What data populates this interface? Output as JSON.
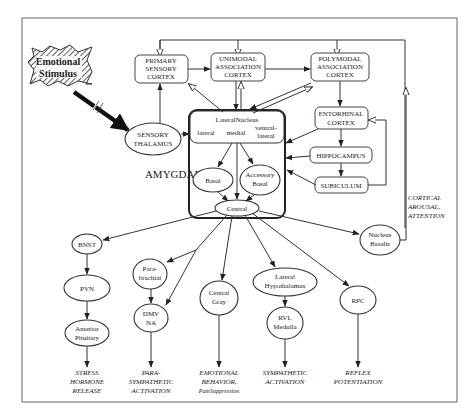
{
  "diagram": {
    "stimulus": {
      "line1": "Emotional",
      "line2": "Stimulus"
    },
    "amygdala_label": "AMYGDALA",
    "cortex": {
      "primary": [
        "PRIMARY",
        "SENSORY",
        "CORTEX"
      ],
      "unimodal": [
        "UNIMODAL",
        "ASSOCIATION",
        "CORTEX"
      ],
      "polymodal": [
        "POLYMODAL",
        "ASSOCIATION",
        "CORTEX"
      ],
      "entorhinal": [
        "ENTORHINAL",
        "CORTEX"
      ],
      "hippocampus": "HIPPOCAMPUS",
      "subiculum": "SUBICULUM"
    },
    "sensory_thalamus": [
      "SENSORY",
      "THALAMUS"
    ],
    "lateral_nucleus": {
      "title": "LateralNucleus",
      "parts": [
        "lateral",
        "medial",
        "ventral-",
        "lateral"
      ]
    },
    "basal": "Basal",
    "accessory_basal": [
      "Accessory",
      "Basal"
    ],
    "central": "Central",
    "nucleus_basalis": [
      "Nucleus",
      "Basalis"
    ],
    "cortical_arousal": [
      "CORTICAL",
      "AROUSAL,",
      "ATTENTION"
    ],
    "outputs": {
      "bnst": "BNST",
      "pvn": "PVN",
      "anterior_pituitary": [
        "Anterior",
        "Pituitary"
      ],
      "parabrachial": [
        "Para-",
        "brachial"
      ],
      "dmv_na": [
        "DMV",
        "NA"
      ],
      "central_gray": [
        "Central",
        "Gray"
      ],
      "lateral_hypothalamus": [
        "Lateral",
        "Hypothalamus"
      ],
      "rvl_medulla": [
        "RVL",
        "Medulla"
      ],
      "rpc": "RPC"
    },
    "responses": {
      "stress": [
        "STRESS",
        "HORMONE",
        "RELEASE"
      ],
      "parasympathetic": [
        "PARA-",
        "SYMPATHETIC",
        "ACTIVATION"
      ],
      "emotional": [
        "EMOTIONAL",
        "BEHAVIOR,",
        "PainSuppression"
      ],
      "sympathetic": [
        "SYMPATHETIC",
        "ACTIVATION"
      ],
      "reflex": [
        "REFLEX",
        "POTENTIATION"
      ]
    }
  }
}
